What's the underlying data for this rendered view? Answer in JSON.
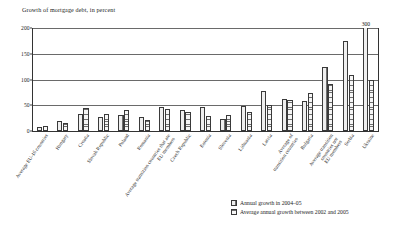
{
  "chart_data": {
    "type": "bar",
    "title": "Growth of mortgage debt, in percent",
    "xlabel": "",
    "ylabel": "",
    "ylim": [
      0,
      200
    ],
    "yticks": [
      0,
      50,
      100,
      150,
      200
    ],
    "grid": true,
    "legend_position": "bottom-right",
    "categories": [
      "Average EU-16 countries",
      "Hungary",
      "Croatia",
      "Slovak Republic",
      "Poland",
      "Romania",
      "Average transition countries that are EU members",
      "Czech Republic",
      "Estonia",
      "Slovenia",
      "Lithuania",
      "Latvia",
      "Average of transition countries",
      "Bulgaria",
      "Average transition countries not EU members",
      "Serbia",
      "Ukraine"
    ],
    "series": [
      {
        "name": "Annual growth in 2004–05",
        "values": [
          8,
          20,
          34,
          28,
          31,
          27,
          47,
          40,
          46,
          24,
          48,
          77,
          62,
          58,
          125,
          175,
          300
        ]
      },
      {
        "name": "Average annual growth between 2002 and 2005",
        "values": [
          10,
          15,
          44,
          33,
          40,
          21,
          42,
          36,
          30,
          32,
          37,
          50,
          60,
          74,
          92,
          108,
          100
        ]
      }
    ],
    "annotations": [
      {
        "series": 0,
        "category_index": 16,
        "label": "300",
        "note": "bar clipped at top of axis"
      }
    ]
  },
  "legend": {
    "items": [
      {
        "label": "Annual growth in 2004–05",
        "swatch": "vertical-hatch"
      },
      {
        "label": "Average annual growth between 2002 and 2005",
        "swatch": "horizontal-hatch"
      }
    ]
  },
  "axis": {
    "y_tick_labels": [
      "0",
      "50",
      "100",
      "150",
      "200"
    ]
  }
}
